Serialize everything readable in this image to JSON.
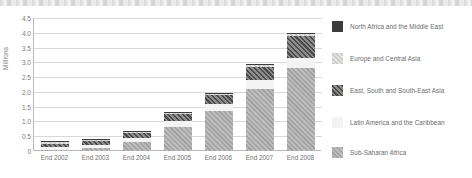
{
  "chart_data": {
    "type": "bar",
    "stacked": true,
    "title": "",
    "xlabel": "",
    "ylabel": "Millions",
    "ylim": [
      0,
      4.5
    ],
    "ytick_labels": [
      "4.5",
      "4.0",
      "3.5",
      "3.0",
      "2.5",
      "2.0",
      "1.5",
      "1.0",
      "0.5",
      "0"
    ],
    "ytick_values": [
      4.5,
      4.0,
      3.5,
      3.0,
      2.5,
      2.0,
      1.5,
      1.0,
      0.5,
      0
    ],
    "grid": true,
    "legend_position": "right",
    "categories": [
      "End 2002",
      "End 2003",
      "End 2004",
      "End 2005",
      "End 2006",
      "End 2007",
      "End 2008"
    ],
    "series": [
      {
        "name": "Sub-Saharan Africa",
        "values": [
          0.05,
          0.1,
          0.3,
          0.8,
          1.35,
          2.1,
          2.8
        ]
      },
      {
        "name": "Latin America and the Caribbean",
        "values": [
          0.1,
          0.12,
          0.15,
          0.2,
          0.25,
          0.3,
          0.35
        ]
      },
      {
        "name": "East, South and South-East Asia",
        "values": [
          0.1,
          0.12,
          0.15,
          0.25,
          0.3,
          0.45,
          0.75
        ]
      },
      {
        "name": "Europe and Central Asia",
        "values": [
          0.03,
          0.03,
          0.03,
          0.03,
          0.04,
          0.05,
          0.05
        ]
      },
      {
        "name": "North Africa and the Middle East",
        "values": [
          0.01,
          0.01,
          0.01,
          0.01,
          0.01,
          0.02,
          0.02
        ]
      }
    ],
    "totals": [
      0.29,
      0.38,
      0.64,
      1.29,
      1.95,
      2.92,
      3.97
    ]
  },
  "legend": {
    "items": [
      {
        "label": "North Africa and the Middle East",
        "swatch": "solid-dark-swatch",
        "color": "#3c3c3c"
      },
      {
        "label": "Europe and Central Asia",
        "swatch": "light-hatch-swatch",
        "color": "#d6d6d6"
      },
      {
        "label": "East, South and South-East Asia",
        "swatch": "dark-hatch-swatch",
        "color": "#5a5a5a"
      },
      {
        "label": "Latin America and the Caribbean",
        "swatch": "white-swatch",
        "color": "#f3f3f3"
      },
      {
        "label": "Sub-Saharan Africa",
        "swatch": "gray-hatch-swatch",
        "color": "#b0b0b0"
      }
    ]
  }
}
